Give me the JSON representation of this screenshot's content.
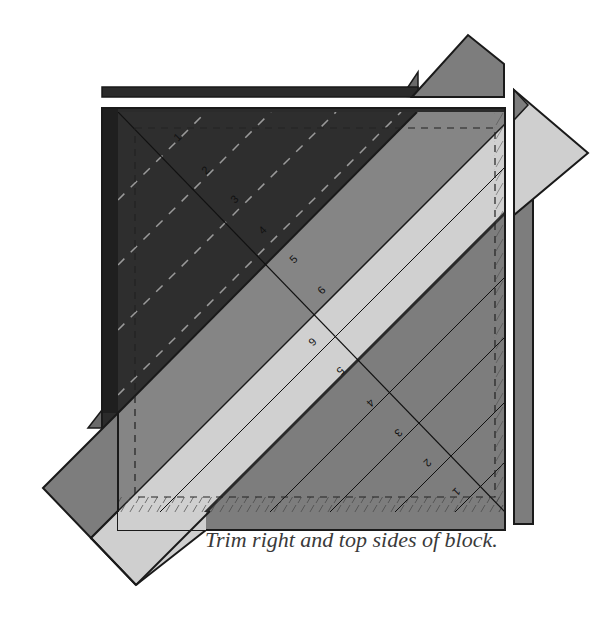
{
  "figure": {
    "caption": "Trim right and top sides of block.",
    "ruler_labels_upper": [
      "1",
      "2",
      "3",
      "4",
      "5",
      "6"
    ],
    "ruler_labels_lower": [
      "6",
      "5",
      "4",
      "3",
      "2",
      "1"
    ],
    "colors": {
      "dark_fabric": "#2b2b2b",
      "mid_fabric": "#7d7d7d",
      "light_fabric": "#cfcfcf",
      "outline": "#1a1a1a",
      "ruler_line": "#111111",
      "caption_text": "#3a3a3a"
    }
  }
}
